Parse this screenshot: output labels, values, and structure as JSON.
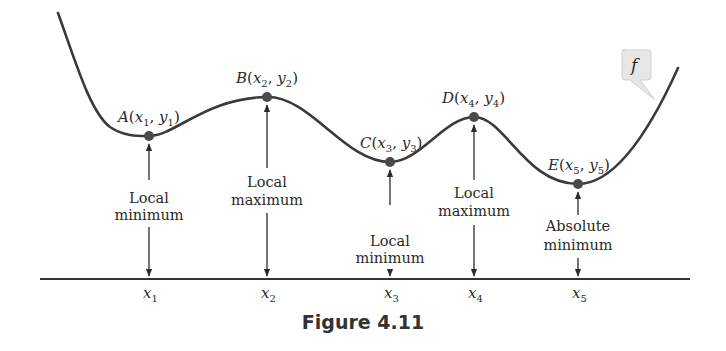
{
  "figure": {
    "caption": "Figure 4.11",
    "function_label": "f",
    "points": [
      {
        "id": "A",
        "label": "A(x1, y1)",
        "letter": "A",
        "sub_x": "1",
        "sub_y": "1",
        "type": "Local minimum",
        "type_line1": "Local",
        "type_line2": "minimum",
        "tick": "x1",
        "tick_sub": "1"
      },
      {
        "id": "B",
        "label": "B(x2, y2)",
        "letter": "B",
        "sub_x": "2",
        "sub_y": "2",
        "type": "Local maximum",
        "type_line1": "Local",
        "type_line2": "maximum",
        "tick": "x2",
        "tick_sub": "2"
      },
      {
        "id": "C",
        "label": "C(x3, y3)",
        "letter": "C",
        "sub_x": "3",
        "sub_y": "3",
        "type": "Local minimum",
        "type_line1": "Local",
        "type_line2": "minimum",
        "tick": "x3",
        "tick_sub": "3"
      },
      {
        "id": "D",
        "label": "D(x4, y4)",
        "letter": "D",
        "sub_x": "4",
        "sub_y": "4",
        "type": "Local maximum",
        "type_line1": "Local",
        "type_line2": "maximum",
        "tick": "x4",
        "tick_sub": "4"
      },
      {
        "id": "E",
        "label": "E(x5, y5)",
        "letter": "E",
        "sub_x": "5",
        "sub_y": "5",
        "type": "Absolute minimum",
        "type_line1": "Absolute",
        "type_line2": "minimum",
        "tick": "x5",
        "tick_sub": "5"
      }
    ],
    "tick_var": "x",
    "colors": {
      "curve": "#3a3a3a",
      "point": "#4a4a4a",
      "axis": "#333333",
      "callout_bg": "#e4e4e4"
    }
  }
}
